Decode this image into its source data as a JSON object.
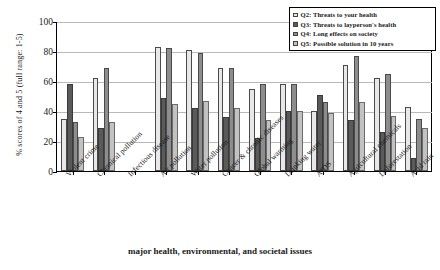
{
  "chart_data": {
    "type": "bar",
    "title": "",
    "xlabel": "major health, environmental, and societal issues",
    "ylabel": "% scores of 4 and 5 (full range: 1-5)",
    "ylim": [
      0,
      100
    ],
    "yticks": [
      0,
      20,
      40,
      60,
      80,
      100
    ],
    "grid": true,
    "legend_position": "top-right",
    "categories": [
      "Violent crime",
      "Chemical pollution",
      "Infectious disease",
      "Air pollution",
      "Water pollution",
      "Cancer & chronic diseases",
      "Global warming",
      "Drinking water",
      "AIDS",
      "Agricultural chemicals",
      "Deforestation",
      "Acid rain"
    ],
    "series": [
      {
        "name": "Q2: Threats to your health",
        "color": "#e8e8e8",
        "values": [
          35,
          62,
          null,
          83,
          81,
          69,
          55,
          58,
          40,
          71,
          62,
          43
        ]
      },
      {
        "name": "Q3: Threats to layperson's health",
        "color": "#5a5a5a",
        "values": [
          58,
          29,
          null,
          49,
          42,
          36,
          22,
          40,
          51,
          34,
          26,
          9
        ]
      },
      {
        "name": "Q4: Long effects on society",
        "color": "#8d8d8d",
        "values": [
          33,
          69,
          null,
          82,
          79,
          69,
          58,
          58,
          46,
          77,
          65,
          35
        ]
      },
      {
        "name": "Q5: Possible solution in 10 years",
        "color": "#c2c2c2",
        "values": [
          23,
          33,
          null,
          45,
          47,
          42,
          34,
          40,
          39,
          46,
          37,
          29
        ]
      }
    ]
  },
  "legend": {
    "items": [
      {
        "label": "Q2: Threats to your health"
      },
      {
        "label": "Q3: Threats to layperson's health"
      },
      {
        "label": "Q4: Long effects on society"
      },
      {
        "label": "Q5: Possible solution in 10 years"
      }
    ]
  }
}
